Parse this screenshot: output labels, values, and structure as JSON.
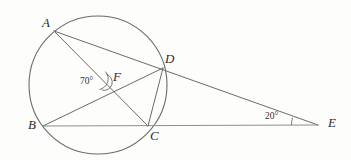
{
  "figure": {
    "kind": "circle-geometry-diagram",
    "width": 351,
    "height": 160,
    "background_color": "#fdfdfc",
    "stroke_color": "#6b6b6b",
    "text_color": "#2e2e2e"
  },
  "circle": {
    "center_x": 98,
    "center_y": 85,
    "radius": 69,
    "label": "circle"
  },
  "points": [
    {
      "id": "A",
      "label": "A",
      "x": 54,
      "y": 31,
      "label_x": 42,
      "label_y": 16,
      "on_circle": true
    },
    {
      "id": "B",
      "label": "B",
      "x": 43,
      "y": 126,
      "label_x": 28,
      "label_y": 118,
      "on_circle": true
    },
    {
      "id": "C",
      "label": "C",
      "x": 148,
      "y": 126,
      "label_x": 150,
      "label_y": 129,
      "on_circle": true
    },
    {
      "id": "D",
      "label": "D",
      "x": 163,
      "y": 68,
      "label_x": 165,
      "label_y": 52,
      "on_circle": true
    },
    {
      "id": "E",
      "label": "E",
      "x": 318,
      "y": 125,
      "label_x": 328,
      "label_y": 116,
      "on_circle": false
    },
    {
      "id": "F",
      "label": "F",
      "x": 108,
      "y": 82,
      "label_x": 113,
      "label_y": 70,
      "on_circle": false
    }
  ],
  "segments": [
    {
      "id": "AE",
      "from": "A",
      "to": "E",
      "through": [
        "D"
      ],
      "note": "secant A through D to E"
    },
    {
      "id": "AC",
      "from": "A",
      "to": "C",
      "through": [
        "F"
      ],
      "note": "chord A to C crossing at F"
    },
    {
      "id": "BE",
      "from": "B",
      "to": "E",
      "through": [
        "C"
      ],
      "note": "secant B through C to E"
    },
    {
      "id": "BD",
      "from": "B",
      "to": "D",
      "through": [
        "F"
      ],
      "note": "chord B to D crossing at F"
    },
    {
      "id": "DC",
      "from": "D",
      "to": "C",
      "through": [],
      "note": "chord D to C"
    }
  ],
  "angles": [
    {
      "id": "angle-F",
      "value": "70°",
      "vertex": "F",
      "label_x": 80,
      "label_y": 77,
      "arc_marks": 2
    },
    {
      "id": "angle-E",
      "value": "20°",
      "vertex": "E",
      "label_x": 265,
      "label_y": 112,
      "arc_marks": 1
    }
  ]
}
